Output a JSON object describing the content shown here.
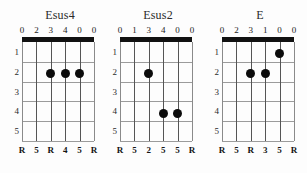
{
  "page": {
    "kind": "guitar-chord-diagram-sheet",
    "background_color": "#fdfdfd",
    "ink_color": "#111111",
    "grid_color": "#9b9b9b",
    "string_color": "#555555"
  },
  "diagram_spec": {
    "string_count": 6,
    "fret_count": 5,
    "fret_numbers": [
      "1",
      "2",
      "3",
      "4",
      "5"
    ],
    "nut_label": "nut",
    "dot_color": "#0b0b0b"
  },
  "chords": [
    {
      "name": "Esus4",
      "top_numbers": [
        "0",
        "2",
        "3",
        "4",
        "0",
        "0"
      ],
      "bottom_numbers": [
        "R",
        "5",
        "R",
        "4",
        "5",
        "R"
      ],
      "dots": [
        {
          "string": 2,
          "fret": 2
        },
        {
          "string": 3,
          "fret": 2
        },
        {
          "string": 4,
          "fret": 2
        }
      ]
    },
    {
      "name": "Esus2",
      "top_numbers": [
        "0",
        "1",
        "3",
        "4",
        "0",
        "0"
      ],
      "bottom_numbers": [
        "R",
        "5",
        "2",
        "5",
        "5",
        "R"
      ],
      "dots": [
        {
          "string": 2,
          "fret": 2
        },
        {
          "string": 3,
          "fret": 4
        },
        {
          "string": 4,
          "fret": 4
        }
      ]
    },
    {
      "name": "E",
      "top_numbers": [
        "0",
        "2",
        "3",
        "1",
        "0",
        "0"
      ],
      "bottom_numbers": [
        "R",
        "5",
        "R",
        "3",
        "5",
        "R"
      ],
      "dots": [
        {
          "string": 4,
          "fret": 1
        },
        {
          "string": 2,
          "fret": 2
        },
        {
          "string": 3,
          "fret": 2
        }
      ]
    }
  ]
}
